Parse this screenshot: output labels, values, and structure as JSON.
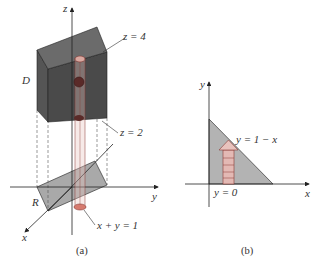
{
  "figure": {
    "panel_a": {
      "caption": "(a)",
      "axes": {
        "z": "z",
        "y": "y",
        "x": "x"
      },
      "labels": {
        "solid": "D",
        "region": "R",
        "top_plane": "z = 4",
        "bottom_plane": "z = 2",
        "boundary_line": "x + y = 1"
      }
    },
    "panel_b": {
      "caption": "(b)",
      "axes": {
        "y": "y",
        "x": "x"
      },
      "labels": {
        "upper_boundary": "y = 1 − x",
        "lower_boundary": "y = 0"
      }
    },
    "colors": {
      "box_front": "#4a4a4a",
      "box_top": "#6b6b6b",
      "box_side": "#5a5a5a",
      "region_fill": "#a9a9a9",
      "triangle_fill": "#b3b3b3",
      "column_fill": "#e8c2bd",
      "column_stroke": "#8a3a35",
      "axis": "#222222"
    }
  }
}
